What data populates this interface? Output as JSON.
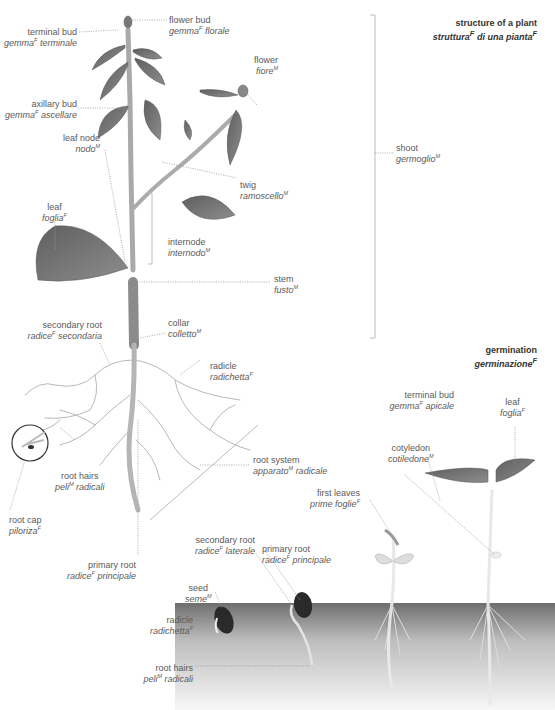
{
  "titles": {
    "structure": {
      "en": "structure of a plant",
      "it": "struttura",
      "it_g": "F",
      "it_rest": " di una pianta",
      "it_g2": "F"
    },
    "germination": {
      "en": "germination",
      "it": "germinazione",
      "it_g": "F"
    }
  },
  "plant_labels": {
    "flower_bud": {
      "en": "flower bud",
      "it": "gemma",
      "g": "F",
      "it2": " florale"
    },
    "terminal_bud": {
      "en": "terminal bud",
      "it": "gemma",
      "g": "F",
      "it2": " terminale"
    },
    "flower": {
      "en": "flower",
      "it": "fiore",
      "g": "M",
      "it2": ""
    },
    "axillary_bud": {
      "en": "axillary bud",
      "it": "gemma",
      "g": "F",
      "it2": " ascellare"
    },
    "leaf_node": {
      "en": "leaf node",
      "it": "nodo",
      "g": "M",
      "it2": ""
    },
    "shoot": {
      "en": "shoot",
      "it": "germoglio",
      "g": "M",
      "it2": ""
    },
    "twig": {
      "en": "twig",
      "it": "ramoscello",
      "g": "M",
      "it2": ""
    },
    "leaf": {
      "en": "leaf",
      "it": "foglia",
      "g": "F",
      "it2": ""
    },
    "internode": {
      "en": "internode",
      "it": "internodo",
      "g": "M",
      "it2": ""
    },
    "stem": {
      "en": "stem",
      "it": "fusto",
      "g": "M",
      "it2": ""
    },
    "collar": {
      "en": "collar",
      "it": "colletto",
      "g": "M",
      "it2": ""
    },
    "secondary_root": {
      "en": "secondary root",
      "it": "radice",
      "g": "F",
      "it2": " secondaria"
    },
    "radicle": {
      "en": "radicle",
      "it": "radichetta",
      "g": "F",
      "it2": ""
    },
    "root_hairs": {
      "en": "root hairs",
      "it": "peli",
      "g": "M",
      "it2": " radicali"
    },
    "root_system": {
      "en": "root system",
      "it": "apparato",
      "g": "M",
      "it2": " radicale"
    },
    "root_cap": {
      "en": "root cap",
      "it": "piloriza",
      "g": "F",
      "it2": ""
    },
    "primary_root": {
      "en": "primary root",
      "it": "radice",
      "g": "F",
      "it2": " principale"
    }
  },
  "germination_labels": {
    "terminal_bud": {
      "en": "terminal bud",
      "it": "gemma",
      "g": "F",
      "it2": " apicale"
    },
    "leaf": {
      "en": "leaf",
      "it": "foglia",
      "g": "F",
      "it2": ""
    },
    "cotyledon": {
      "en": "cotyledon",
      "it": "cotiledone",
      "g": "M",
      "it2": ""
    },
    "first_leaves": {
      "en": "first leaves",
      "it": "prime foglie",
      "g": "F",
      "it2": ""
    },
    "secondary_root": {
      "en": "secondary root",
      "it": "radice",
      "g": "F",
      "it2": " laterale"
    },
    "primary_root": {
      "en": "primary root",
      "it": "radice",
      "g": "F",
      "it2": " principale"
    },
    "seed": {
      "en": "seed",
      "it": "seme",
      "g": "M",
      "it2": ""
    },
    "radicle": {
      "en": "radicle",
      "it": "radichetta",
      "g": "F",
      "it2": ""
    },
    "root_hairs": {
      "en": "root hairs",
      "it": "peli",
      "g": "M",
      "it2": " radicali"
    }
  },
  "colors": {
    "leaf": "#6f6f6f",
    "stem": "#a8a8a8",
    "soil_top": "#6e6e6e",
    "soil_bottom": "#f4f4f4",
    "text": "#5a5a5a"
  }
}
